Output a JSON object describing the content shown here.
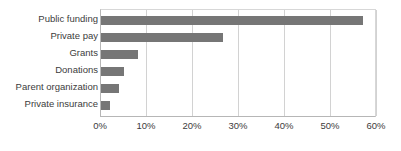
{
  "figure": {
    "title_sliver": "",
    "background_color": "#ffffff",
    "bar_color": "#767676",
    "gridline_color": "#d2d2d2",
    "axis_color": "#b6b6b6",
    "label_color": "#3c3c3c"
  },
  "chart_data": {
    "type": "bar",
    "orientation": "horizontal",
    "title": "",
    "subtitle": "",
    "xlabel": "",
    "ylabel": "",
    "categories": [
      "Public funding",
      "Private pay",
      "Grants",
      "Donations",
      "Parent organization",
      "Private insurance"
    ],
    "values": [
      57,
      26.5,
      8,
      5,
      4,
      2
    ],
    "value_unit": "%",
    "xlim": [
      0,
      60
    ],
    "xticks": [
      0,
      10,
      20,
      30,
      40,
      50,
      60
    ],
    "xtick_labels": [
      "0%",
      "10%",
      "20%",
      "30%",
      "40%",
      "50%",
      "60%"
    ],
    "grid": true,
    "grid_axis": "x",
    "legend": false,
    "legend_position": "none",
    "series": [
      {
        "name": "Share of respondents",
        "values": [
          57,
          26.5,
          8,
          5,
          4,
          2
        ]
      }
    ]
  }
}
